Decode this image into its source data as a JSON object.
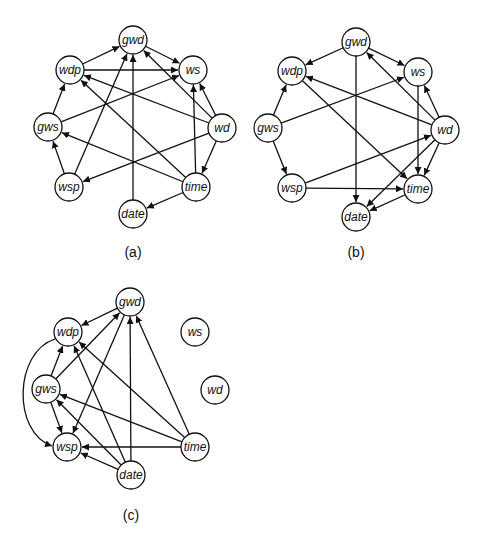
{
  "figure": {
    "panels": [
      {
        "id": "a",
        "caption": "(a)",
        "caption_pos": [
          133,
          252
        ],
        "nodes": [
          {
            "id": "gwd",
            "label": "gwd",
            "x": 133,
            "y": 40
          },
          {
            "id": "ws",
            "label": "ws",
            "x": 193,
            "y": 70
          },
          {
            "id": "wd",
            "label": "wd",
            "x": 222,
            "y": 128
          },
          {
            "id": "time",
            "label": "time",
            "x": 196,
            "y": 187
          },
          {
            "id": "date",
            "label": "date",
            "x": 133,
            "y": 214
          },
          {
            "id": "wsp",
            "label": "wsp",
            "x": 69,
            "y": 187
          },
          {
            "id": "gws",
            "label": "gws",
            "x": 48,
            "y": 127
          },
          {
            "id": "wdp",
            "label": "wdp",
            "x": 70,
            "y": 70
          }
        ],
        "edges": [
          [
            "wdp",
            "gwd"
          ],
          [
            "gwd",
            "ws"
          ],
          [
            "wdp",
            "ws"
          ],
          [
            "gws",
            "wdp"
          ],
          [
            "gws",
            "ws"
          ],
          [
            "wsp",
            "gws"
          ],
          [
            "wsp",
            "gwd"
          ],
          [
            "date",
            "gwd"
          ],
          [
            "wd",
            "gwd"
          ],
          [
            "wd",
            "ws"
          ],
          [
            "wd",
            "wdp"
          ],
          [
            "wd",
            "wsp"
          ],
          [
            "wd",
            "time"
          ],
          [
            "time",
            "ws"
          ],
          [
            "time",
            "wdp"
          ],
          [
            "time",
            "gws"
          ],
          [
            "time",
            "date"
          ]
        ]
      },
      {
        "id": "b",
        "caption": "(b)",
        "caption_pos": [
          356,
          252
        ],
        "nodes": [
          {
            "id": "gwd",
            "label": "gwd",
            "x": 356,
            "y": 42
          },
          {
            "id": "ws",
            "label": "ws",
            "x": 418,
            "y": 72
          },
          {
            "id": "wd",
            "label": "wd",
            "x": 445,
            "y": 130
          },
          {
            "id": "time",
            "label": "time",
            "x": 418,
            "y": 189
          },
          {
            "id": "date",
            "label": "date",
            "x": 356,
            "y": 217
          },
          {
            "id": "wsp",
            "label": "wsp",
            "x": 292,
            "y": 188
          },
          {
            "id": "gws",
            "label": "gws",
            "x": 268,
            "y": 128
          },
          {
            "id": "wdp",
            "label": "wdp",
            "x": 292,
            "y": 71
          }
        ],
        "edges": [
          [
            "gwd",
            "wdp"
          ],
          [
            "gwd",
            "ws"
          ],
          [
            "gwd",
            "date"
          ],
          [
            "gws",
            "wdp"
          ],
          [
            "gws",
            "ws"
          ],
          [
            "gws",
            "wsp"
          ],
          [
            "wdp",
            "time"
          ],
          [
            "wd",
            "gwd"
          ],
          [
            "wd",
            "wdp"
          ],
          [
            "wd",
            "ws"
          ],
          [
            "wd",
            "time"
          ],
          [
            "wd",
            "date"
          ],
          [
            "ws",
            "time"
          ],
          [
            "wsp",
            "wd"
          ],
          [
            "wsp",
            "time"
          ],
          [
            "time",
            "date"
          ]
        ]
      },
      {
        "id": "c",
        "caption": "(c)",
        "caption_pos": [
          131,
          515
        ],
        "nodes": [
          {
            "id": "gwd",
            "label": "gwd",
            "x": 130,
            "y": 302
          },
          {
            "id": "ws",
            "label": "ws",
            "x": 195,
            "y": 332
          },
          {
            "id": "wd",
            "label": "wd",
            "x": 215,
            "y": 390
          },
          {
            "id": "time",
            "label": "time",
            "x": 195,
            "y": 447
          },
          {
            "id": "date",
            "label": "date",
            "x": 131,
            "y": 475
          },
          {
            "id": "wsp",
            "label": "wsp",
            "x": 67,
            "y": 447
          },
          {
            "id": "gws",
            "label": "gws",
            "x": 46,
            "y": 389
          },
          {
            "id": "wdp",
            "label": "wdp",
            "x": 68,
            "y": 332
          }
        ],
        "edges": [
          [
            "gwd",
            "wdp"
          ],
          [
            "gws",
            "gwd"
          ],
          [
            "gwd",
            "wsp"
          ],
          [
            "date",
            "gwd"
          ],
          [
            "time",
            "gwd"
          ],
          [
            "gws",
            "wdp"
          ],
          [
            "gws",
            "wsp"
          ],
          [
            "date",
            "wdp"
          ],
          [
            "time",
            "wdp"
          ],
          [
            "date",
            "gws"
          ],
          [
            "time",
            "gws"
          ],
          [
            "date",
            "wsp"
          ],
          [
            "time",
            "wsp"
          ]
        ],
        "curved_edges": [
          {
            "from": "wdp",
            "to": "wsp",
            "path": "M 55 339 C 14 352, 12 432, 52 446"
          }
        ]
      }
    ],
    "node_radius": 14
  }
}
